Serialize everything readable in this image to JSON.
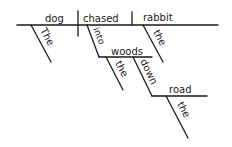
{
  "diagram": {
    "type": "sentence-diagram",
    "sentence": "The dog chased the rabbit into the woods down the road",
    "subject": "dog",
    "verb": "chased",
    "object": "rabbit",
    "modifiers": {
      "subject_article": "The",
      "object_article": "the",
      "preposition_1": "into",
      "preposition_1_object": "woods",
      "preposition_1_article": "the",
      "preposition_2": "down",
      "preposition_2_object": "road",
      "preposition_2_article": "the"
    },
    "ink_color": "#1a1a1a",
    "background_color": "#ffffff"
  }
}
